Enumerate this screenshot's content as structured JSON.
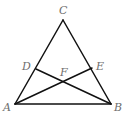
{
  "diagram": {
    "type": "geometry-triangle",
    "stroke_color": "#111111",
    "label_color": "#6e6e6e",
    "points": {
      "A": {
        "label": "A",
        "x": 15,
        "y": 104,
        "lx": 3,
        "ly": 111
      },
      "B": {
        "label": "B",
        "x": 111,
        "y": 104,
        "lx": 114,
        "ly": 111
      },
      "C": {
        "label": "C",
        "x": 63,
        "y": 20,
        "lx": 59,
        "ly": 14
      },
      "D": {
        "label": "D",
        "x": 36,
        "y": 69,
        "lx": 22,
        "ly": 70
      },
      "E": {
        "label": "E",
        "x": 92,
        "y": 68,
        "lx": 96,
        "ly": 70
      },
      "F": {
        "label": "F",
        "x": 64,
        "y": 81,
        "lx": 60,
        "ly": 76
      }
    },
    "segments": [
      {
        "name": "segment-AB",
        "from": "A",
        "to": "B"
      },
      {
        "name": "segment-AC",
        "from": "A",
        "to": "C"
      },
      {
        "name": "segment-BC",
        "from": "B",
        "to": "C"
      },
      {
        "name": "segment-AE",
        "from": "A",
        "to": "E"
      },
      {
        "name": "segment-BD",
        "from": "B",
        "to": "D"
      }
    ]
  }
}
